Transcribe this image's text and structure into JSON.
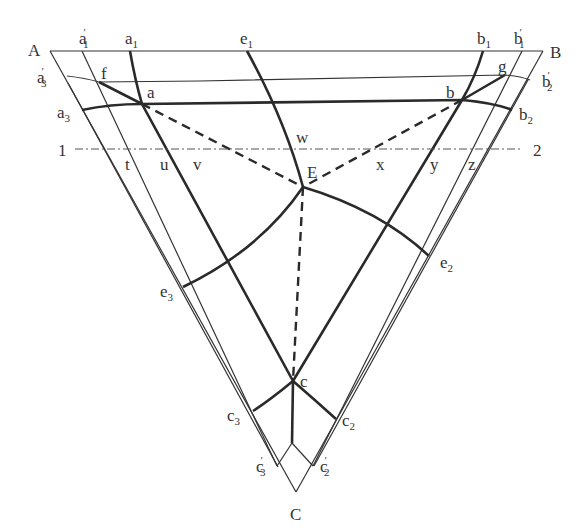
{
  "diagram": {
    "type": "triangular construction diagram",
    "vertices": {
      "A": "A",
      "B": "B",
      "C": "C"
    },
    "points": {
      "a": "a",
      "b": "b",
      "c": "c",
      "E": "E",
      "f": "f",
      "g": "g",
      "t": "t",
      "u": "u",
      "v": "v",
      "w": "w",
      "x": "x",
      "y": "y",
      "z": "z"
    },
    "edge_labels": {
      "a1p": {
        "base": "a",
        "sub": "1",
        "prime": "′"
      },
      "a1": {
        "base": "a",
        "sub": "1"
      },
      "e1": {
        "base": "e",
        "sub": "1"
      },
      "b1": {
        "base": "b",
        "sub": "1"
      },
      "b1p": {
        "base": "b",
        "sub": "1",
        "prime": "′"
      },
      "a3p": {
        "base": "a",
        "sub": "3",
        "prime": "′"
      },
      "a3": {
        "base": "a",
        "sub": "3"
      },
      "b2p": {
        "base": "b",
        "sub": "2",
        "prime": "′"
      },
      "b2": {
        "base": "b",
        "sub": "2"
      },
      "e2": {
        "base": "e",
        "sub": "2"
      },
      "e3": {
        "base": "e",
        "sub": "3"
      },
      "c3": {
        "base": "c",
        "sub": "3"
      },
      "c2": {
        "base": "c",
        "sub": "2"
      },
      "c3p": {
        "base": "c",
        "sub": "3",
        "prime": "′"
      },
      "c2p": {
        "base": "c",
        "sub": "2",
        "prime": "′"
      }
    },
    "section_line": {
      "start": "1",
      "end": "2"
    }
  }
}
